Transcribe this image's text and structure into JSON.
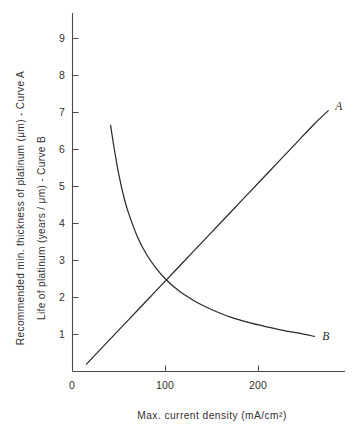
{
  "chart_data": {
    "type": "line",
    "title": "",
    "subtitle": "",
    "xlabel": "Max. current density (mA/cm²)",
    "ylabel_primary": "Recommended min. thickness of platinum (μm) - Curve A",
    "ylabel_secondary": "Life of platinum (years / μm) - Curve B",
    "xlim": [
      0,
      295
    ],
    "ylim": [
      0,
      9.6
    ],
    "grid": false,
    "legend": "inline-end-labels",
    "x_ticks": [
      0,
      100,
      200
    ],
    "x_tick_labels": [
      "0",
      "100",
      "200"
    ],
    "y_ticks": [
      1,
      2,
      3,
      4,
      5,
      6,
      7,
      8,
      9
    ],
    "y_tick_labels": [
      "1",
      "2",
      "3",
      "4",
      "5",
      "6",
      "7",
      "8",
      "9"
    ],
    "annotations": [
      {
        "text": "A",
        "x": 283,
        "y": 7.1
      },
      {
        "text": "B",
        "x": 269,
        "y": 0.95
      }
    ],
    "series": [
      {
        "name": "A",
        "label": "A",
        "description": "Recommended min. thickness of platinum (μm)",
        "style": "solid",
        "color": "#2b2b2b",
        "x": [
          15,
          40,
          60,
          80,
          100,
          120,
          140,
          160,
          180,
          200,
          220,
          240,
          260,
          275
        ],
        "values": [
          0.2,
          0.86,
          1.39,
          1.92,
          2.45,
          2.98,
          3.51,
          4.04,
          4.57,
          5.1,
          5.63,
          6.16,
          6.69,
          7.05
        ]
      },
      {
        "name": "B",
        "label": "B",
        "description": "Life of platinum (years / μm)",
        "style": "solid",
        "color": "#2b2b2b",
        "x": [
          41,
          45,
          50,
          55,
          60,
          70,
          80,
          90,
          100,
          110,
          120,
          135,
          150,
          170,
          190,
          210,
          230,
          245,
          260
        ],
        "values": [
          6.65,
          6.0,
          5.3,
          4.74,
          4.3,
          3.63,
          3.15,
          2.79,
          2.5,
          2.27,
          2.08,
          1.85,
          1.67,
          1.47,
          1.32,
          1.2,
          1.09,
          1.03,
          0.95
        ]
      }
    ],
    "crossing_point": {
      "x": 102,
      "y": 2.5
    }
  },
  "figure": {
    "background_color": "#ffffff",
    "axis_color": "#4a4a4a",
    "curve_color": "#2b2b2b",
    "text_color": "#33312f"
  }
}
